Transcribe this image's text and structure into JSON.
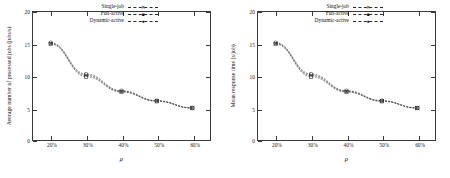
{
  "figure": {
    "panel_count": 2,
    "background": "#ffffff",
    "axis_color": "#3a3a3a",
    "series_color": "#2e2e2e"
  },
  "chart_data": [
    {
      "type": "line",
      "title": "",
      "xlabel": "ρ",
      "ylabel": "Average number of processed jobs (jobs/s)",
      "xlim": [
        15,
        65
      ],
      "ylim": [
        0,
        20
      ],
      "x": [
        20,
        30,
        40,
        50,
        60
      ],
      "xtick_labels": [
        "20%",
        "30%",
        "40%",
        "50%",
        "60%"
      ],
      "ytick_labels": [
        "0",
        "5",
        "10",
        "15",
        "20"
      ],
      "ytick_values": [
        0,
        5,
        10,
        15,
        20
      ],
      "grid": false,
      "legend_position": "top-center",
      "series": [
        {
          "name": "Single-job",
          "marker": "x",
          "values": [
            15.1,
            10.1,
            7.6,
            6.1,
            5.0
          ]
        },
        {
          "name": "Full-active",
          "marker": "square",
          "values": [
            15.0,
            9.9,
            7.5,
            6.05,
            4.98
          ]
        },
        {
          "name": "Dynamic-active",
          "marker": "circle",
          "values": [
            15.2,
            10.3,
            7.7,
            6.15,
            5.02
          ]
        }
      ]
    },
    {
      "type": "line",
      "title": "",
      "xlabel": "ρ",
      "ylabel": "Mean response time (s/job)",
      "xlim": [
        15,
        65
      ],
      "ylim": [
        0,
        20
      ],
      "x": [
        20,
        30,
        40,
        50,
        60
      ],
      "xtick_labels": [
        "20%",
        "30%",
        "40%",
        "50%",
        "60%"
      ],
      "ytick_labels": [
        "0",
        "5",
        "10",
        "15",
        "20"
      ],
      "ytick_values": [
        0,
        5,
        10,
        15,
        20
      ],
      "grid": false,
      "legend_position": "top-center",
      "series": [
        {
          "name": "Single-job",
          "marker": "x",
          "values": [
            15.1,
            10.1,
            7.6,
            6.1,
            5.0
          ]
        },
        {
          "name": "Full-active",
          "marker": "square",
          "values": [
            15.0,
            9.9,
            7.5,
            6.05,
            4.98
          ]
        },
        {
          "name": "Dynamic-active",
          "marker": "circle",
          "values": [
            15.2,
            10.3,
            7.7,
            6.15,
            5.02
          ]
        }
      ]
    }
  ]
}
